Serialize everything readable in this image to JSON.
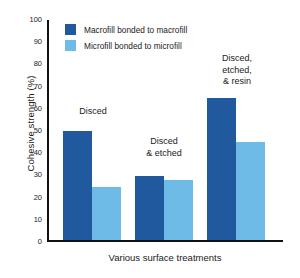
{
  "chart_data": {
    "type": "bar",
    "title": "",
    "xlabel": "Various surface treatments",
    "ylabel": "Cohesive strength (%)",
    "ylim": [
      0,
      100
    ],
    "yticks": [
      0,
      10,
      20,
      30,
      40,
      50,
      60,
      70,
      80,
      90,
      100
    ],
    "grid": false,
    "legend_position": "top-left-inside",
    "categories": [
      "Disced",
      "Disced\n& etched",
      "Disced,\netched,\n& resin"
    ],
    "series": [
      {
        "name": "Macrofill bonded to macrofill",
        "color": "#20599E",
        "values": [
          49,
          29,
          64
        ]
      },
      {
        "name": "Microfill bonded to microfill",
        "color": "#6FBBE8",
        "values": [
          24,
          27,
          44
        ]
      }
    ],
    "annotations": [
      {
        "text": "Disced",
        "category_index": 0
      },
      {
        "text": "Disced\n& etched",
        "category_index": 1
      },
      {
        "text": "Disced,\netched,\n& resin",
        "category_index": 2
      }
    ]
  },
  "axis": {
    "y_title": "Cohesive strength (%)",
    "x_title": "Various surface treatments",
    "tick_0": "0",
    "tick_10": "10",
    "tick_20": "20",
    "tick_30": "30",
    "tick_40": "40",
    "tick_50": "50",
    "tick_60": "60",
    "tick_70": "70",
    "tick_80": "80",
    "tick_90": "90",
    "tick_100": "100"
  },
  "legend": {
    "items": [
      {
        "label": "Macrofill bonded to macrofill",
        "color": "#20599E"
      },
      {
        "label": "Microfill bonded to microfill",
        "color": "#6FBBE8"
      }
    ]
  },
  "group_labels": {
    "g1": "Disced",
    "g2": "Disced\n& etched",
    "g3": "Disced,\netched,\n& resin"
  }
}
